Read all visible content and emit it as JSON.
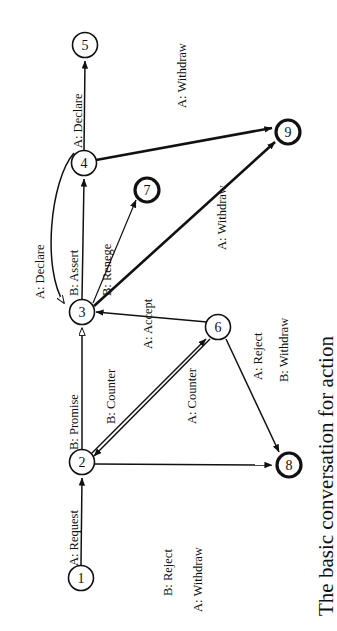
{
  "figure": {
    "caption": "The basic conversation for action",
    "rotation_degrees": -90,
    "type": "state-transition-diagram"
  },
  "colors": {
    "ink": "#111111",
    "paper": "#ffffff"
  },
  "nodes": [
    {
      "id": "1",
      "label": "1",
      "cx": 81,
      "cy": 578,
      "r": 12.5,
      "style": "thin"
    },
    {
      "id": "2",
      "label": "2",
      "cx": 82,
      "cy": 462,
      "r": 12.5,
      "style": "thin"
    },
    {
      "id": "3",
      "label": "3",
      "cx": 82,
      "cy": 312,
      "r": 12.5,
      "style": "thin"
    },
    {
      "id": "4",
      "label": "4",
      "cx": 84,
      "cy": 163,
      "r": 12.5,
      "style": "thin"
    },
    {
      "id": "5",
      "label": "5",
      "cx": 85,
      "cy": 45,
      "r": 12.5,
      "style": "thin"
    },
    {
      "id": "6",
      "label": "6",
      "cx": 218,
      "cy": 327,
      "r": 12.5,
      "style": "thin"
    },
    {
      "id": "7",
      "label": "7",
      "cx": 147,
      "cy": 190,
      "r": 12.5,
      "style": "thick"
    },
    {
      "id": "8",
      "label": "8",
      "cx": 289,
      "cy": 465,
      "r": 12.5,
      "style": "thick"
    },
    {
      "id": "9",
      "label": "9",
      "cx": 288,
      "cy": 132,
      "r": 12.5,
      "style": "thick"
    }
  ],
  "edges": [
    {
      "id": "e1",
      "from": "1",
      "to": "2",
      "label": "A: Request",
      "kind": "straight"
    },
    {
      "id": "e2",
      "from": "2",
      "to": "3",
      "label": "B: Promise",
      "kind": "straight"
    },
    {
      "id": "e3",
      "from": "3",
      "to": "4",
      "label": "B: Assert",
      "kind": "straight"
    },
    {
      "id": "e4",
      "from": "4",
      "to": "5",
      "label": "A: Declare",
      "kind": "straight"
    },
    {
      "id": "e5",
      "from": "4",
      "to": "3",
      "label": "A: Declare",
      "kind": "curved"
    },
    {
      "id": "e6",
      "from": "3",
      "to": "7",
      "label": "B: Renege",
      "kind": "straight"
    },
    {
      "id": "e7",
      "from": "4",
      "to": "9",
      "label": "A: Withdraw",
      "kind": "straight"
    },
    {
      "id": "e8",
      "from": "3",
      "to": "9",
      "label": "A: Withdraw",
      "kind": "straight"
    },
    {
      "id": "e9",
      "from": "6",
      "to": "3",
      "label": "A: Accept",
      "kind": "straight"
    },
    {
      "id": "e10",
      "from": "2",
      "to": "6",
      "label": "B: Counter",
      "kind": "straight"
    },
    {
      "id": "e11",
      "from": "6",
      "to": "2",
      "label": "A: Counter",
      "kind": "straight"
    },
    {
      "id": "e12",
      "from": "6",
      "to": "8",
      "label": "A: Reject",
      "kind": "straight"
    },
    {
      "id": "e13",
      "from": "2",
      "to": "8",
      "label": "B: Reject",
      "kind": "straight"
    },
    {
      "id": "e14",
      "from": "2",
      "to": "8",
      "label": "A: Withdraw",
      "kind": "straight"
    },
    {
      "id": "e15",
      "from": "6",
      "to": "8",
      "label": "B: Withdraw",
      "kind": "straight"
    }
  ],
  "edge_labels": {
    "a_request": "A: Request",
    "b_promise": "B: Promise",
    "b_assert": "B: Assert",
    "a_declare_45": "A: Declare",
    "a_declare_43": "A: Declare",
    "b_renege": "B: Renege",
    "a_withdraw_49": "A: Withdraw",
    "a_withdraw_39": "A: Withdraw",
    "a_accept": "A: Accept",
    "b_counter": "B: Counter",
    "a_counter": "A: Counter",
    "a_reject": "A: Reject",
    "b_reject_bottom": "B: Reject",
    "a_withdraw_bottom": "A: Withdraw",
    "b_withdraw": "B: Withdraw"
  }
}
